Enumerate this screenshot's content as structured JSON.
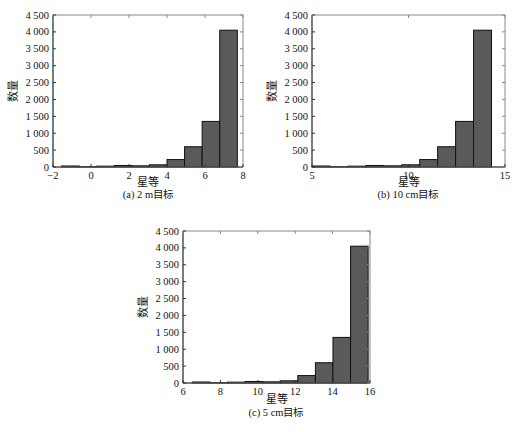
{
  "style": {
    "bar_fill": "#5a5a5a",
    "bar_stroke": "#111111",
    "axis_color": "#888888"
  },
  "chart_data": [
    {
      "id": "a",
      "type": "bar",
      "title": "(a) 2 m目标",
      "xlabel": "星等",
      "ylabel": "数量",
      "xlim": [
        -2,
        8
      ],
      "ylim": [
        0,
        4500
      ],
      "xticks": [
        -2,
        0,
        2,
        4,
        6,
        8
      ],
      "xtick_labels": [
        "−2",
        "0",
        "2",
        "4",
        "6",
        "8"
      ],
      "yticks": [
        0,
        500,
        1000,
        1500,
        2000,
        2500,
        3000,
        3500,
        4000,
        4500
      ],
      "ytick_labels": [
        "0",
        "500",
        "1 000",
        "1 500",
        "2 000",
        "2 500",
        "3 000",
        "3 500",
        "4 000",
        "4 500"
      ],
      "bin_edges": [
        -1.55,
        -0.625,
        0.3,
        1.225,
        2.15,
        3.075,
        4.0,
        4.925,
        5.85,
        6.775,
        7.7
      ],
      "values": [
        30,
        10,
        25,
        45,
        35,
        65,
        220,
        600,
        1350,
        4050
      ],
      "grid": false
    },
    {
      "id": "b",
      "type": "bar",
      "title": "(b) 10 cm目标",
      "xlabel": "星等",
      "ylabel": "数量",
      "xlim": [
        5,
        15
      ],
      "ylim": [
        0,
        4500
      ],
      "xticks": [
        5,
        10,
        15
      ],
      "xtick_labels": [
        "5",
        "10",
        "15"
      ],
      "yticks": [
        0,
        500,
        1000,
        1500,
        2000,
        2500,
        3000,
        3500,
        4000,
        4500
      ],
      "ytick_labels": [
        "0",
        "500",
        "1 000",
        "1 500",
        "2 000",
        "2 500",
        "3 000",
        "3 500",
        "4 000",
        "4 500"
      ],
      "bin_edges": [
        5.0,
        5.93,
        6.86,
        7.79,
        8.72,
        9.65,
        10.58,
        11.51,
        12.44,
        13.37,
        14.3
      ],
      "values": [
        30,
        10,
        25,
        45,
        35,
        65,
        220,
        600,
        1350,
        4050
      ],
      "grid": false
    },
    {
      "id": "c",
      "type": "bar",
      "title": "(c) 5 cm目标",
      "xlabel": "星等",
      "ylabel": "数量",
      "xlim": [
        6,
        16
      ],
      "ylim": [
        0,
        4500
      ],
      "xticks": [
        6,
        8,
        10,
        12,
        14,
        16
      ],
      "xtick_labels": [
        "6",
        "8",
        "10",
        "12",
        "14",
        "16"
      ],
      "yticks": [
        0,
        500,
        1000,
        1500,
        2000,
        2500,
        3000,
        3500,
        4000,
        4500
      ],
      "ytick_labels": [
        "0",
        "500",
        "1 000",
        "1 500",
        "2 000",
        "2 500",
        "3 000",
        "3 500",
        "4 000",
        "4 500"
      ],
      "bin_edges": [
        6.5,
        7.44,
        8.38,
        9.32,
        10.26,
        11.2,
        12.14,
        13.08,
        14.02,
        14.96,
        15.9
      ],
      "values": [
        30,
        10,
        25,
        45,
        35,
        65,
        220,
        600,
        1350,
        4050
      ],
      "grid": false
    }
  ],
  "layout": [
    {
      "left": 53,
      "top": 15,
      "width": 190,
      "height": 152,
      "caption_x": 148,
      "caption_y": 198,
      "xlabel_y": 186
    },
    {
      "left": 312,
      "top": 15,
      "width": 193,
      "height": 152,
      "caption_x": 408,
      "caption_y": 198,
      "xlabel_y": 186
    },
    {
      "left": 183,
      "top": 231,
      "width": 187,
      "height": 152,
      "caption_x": 276,
      "caption_y": 416,
      "xlabel_y": 403
    }
  ]
}
